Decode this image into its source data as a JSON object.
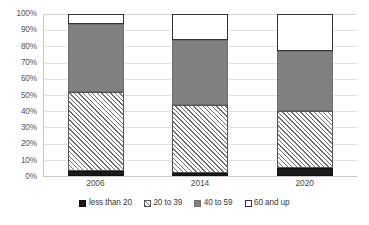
{
  "chart_data": {
    "type": "bar",
    "title": "",
    "subtitle": "",
    "xlabel": "",
    "ylabel": "",
    "stacked": true,
    "stack_mode": "percent",
    "orientation": "vertical",
    "grid": true,
    "grid_axis": "y",
    "legend_position": "bottom",
    "ylim": [
      0,
      100
    ],
    "ytick_labels": [
      "100%",
      "90%",
      "80%",
      "70%",
      "60%",
      "50%",
      "40%",
      "30%",
      "20%",
      "10%",
      "0%"
    ],
    "ytick_values": [
      100,
      90,
      80,
      70,
      60,
      50,
      40,
      30,
      20,
      10,
      0
    ],
    "categories": [
      "2006",
      "2014",
      "2020"
    ],
    "series": [
      {
        "name": "less than 20",
        "pattern": "solid-black",
        "color": "#1a1a1a",
        "values": [
          3,
          2,
          5
        ]
      },
      {
        "name": "20 to 39",
        "pattern": "diagonal-hatch",
        "color": "#ffffff",
        "values": [
          49,
          42,
          35
        ]
      },
      {
        "name": "40 to 59",
        "pattern": "solid-gray",
        "color": "#808080",
        "values": [
          42,
          40,
          37
        ]
      },
      {
        "name": "60 and up",
        "pattern": "white-outline",
        "color": "#ffffff",
        "values": [
          6,
          16,
          23
        ]
      }
    ],
    "cumulative_tops": {
      "2006": [
        3,
        52,
        94,
        100
      ],
      "2014": [
        2,
        44,
        84,
        100
      ],
      "2020": [
        5,
        40,
        77,
        100
      ]
    }
  },
  "legend": {
    "items": [
      {
        "label": "less than 20",
        "swatch": "solid-black-swatch"
      },
      {
        "label": "20 to 39",
        "swatch": "hatch-swatch"
      },
      {
        "label": "40 to 59",
        "swatch": "solid-gray-swatch"
      },
      {
        "label": "60 and up",
        "swatch": "white-outline-swatch"
      }
    ]
  },
  "colors": {
    "series_1": "#1a1a1a",
    "series_2": "#ffffff",
    "series_3": "#808080",
    "series_4": "#ffffff",
    "gridline": "#e2e2e2",
    "axis": "#c8c8c8",
    "text": "#3a3a3a",
    "background": "#ffffff"
  }
}
